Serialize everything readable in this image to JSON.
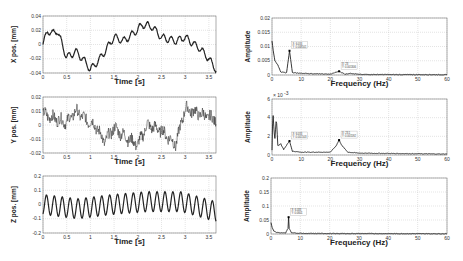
{
  "chart_data": [
    {
      "type": "line",
      "panel": "left-top",
      "xlabel": "Time [s]",
      "ylabel": "X pos. [mm]",
      "xlim": [
        0,
        3.65
      ],
      "ylim": [
        -0.04,
        0.04
      ],
      "xticks": [
        "0",
        "0.5",
        "1",
        "1.5",
        "2",
        "2.5",
        "3",
        "3.5"
      ],
      "yticks": [
        "0.04",
        "0.02",
        "0",
        "-0.02",
        "-0.04"
      ],
      "grid": true,
      "series": [
        {
          "name": "X position",
          "x": [
            0,
            0.1,
            0.2,
            0.3,
            0.5,
            0.7,
            0.9,
            1.0,
            1.2,
            1.5,
            1.7,
            1.9,
            2.1,
            2.3,
            2.5,
            2.8,
            3.0,
            3.3,
            3.5,
            3.65
          ],
          "values": [
            0.0,
            0.02,
            0.015,
            0.02,
            -0.018,
            -0.01,
            -0.025,
            -0.035,
            -0.02,
            0.01,
            0.005,
            0.015,
            0.028,
            0.025,
            0.01,
            0.005,
            0.01,
            -0.005,
            -0.02,
            -0.035
          ]
        }
      ]
    },
    {
      "type": "line",
      "panel": "left-middle",
      "xlabel": "Time [s]",
      "ylabel": "Y pos. [mm]",
      "xlim": [
        0,
        3.65
      ],
      "ylim": [
        -0.02,
        0.02
      ],
      "xticks": [
        "0",
        "0.5",
        "1",
        "1.5",
        "2",
        "2.5",
        "3",
        "3.5"
      ],
      "yticks": [
        "0.02",
        "0.01",
        "0",
        "-0.01",
        "-0.02"
      ],
      "grid": true,
      "series": [
        {
          "name": "Y position",
          "x": [
            0,
            0.3,
            0.5,
            0.7,
            0.9,
            1.1,
            1.3,
            1.5,
            1.8,
            2.0,
            2.2,
            2.5,
            2.8,
            3.0,
            3.3,
            3.65
          ],
          "values": [
            0.008,
            0.004,
            0.002,
            0.01,
            0.004,
            0.0,
            -0.012,
            -0.002,
            -0.01,
            -0.014,
            0.0,
            -0.004,
            -0.014,
            0.012,
            0.008,
            0.004
          ]
        }
      ]
    },
    {
      "type": "line",
      "panel": "left-bottom",
      "xlabel": "Time [s]",
      "ylabel": "Z pos. [mm]",
      "xlim": [
        0,
        3.65
      ],
      "ylim": [
        -0.2,
        0.2
      ],
      "xticks": [
        "0",
        "0.5",
        "1",
        "1.5",
        "2",
        "2.5",
        "3",
        "3.5"
      ],
      "yticks": [
        "0.2",
        "0.1",
        "0",
        "-0.1",
        "-0.2"
      ],
      "grid": true,
      "series": [
        {
          "name": "Z position",
          "oscillation_hz": 6.0,
          "amplitude": 0.07,
          "envelope_center": [
            0,
            -0.03,
            0.0,
            0.02,
            0.02,
            -0.05
          ]
        }
      ]
    },
    {
      "type": "line",
      "panel": "right-top",
      "xlabel": "Frequency (Hz)",
      "ylabel": "Amplitude",
      "xlim": [
        0,
        60
      ],
      "ylim": [
        0,
        0.02
      ],
      "xticks": [
        "0",
        "10",
        "20",
        "30",
        "40",
        "50",
        "60"
      ],
      "yticks": [
        "0.02",
        "0.015",
        "0.01",
        "0.005",
        "0"
      ],
      "grid": true,
      "peaks": [
        {
          "x": 6.0,
          "y": 0.0085,
          "label": [
            "X: 6.033",
            "Y: 0.008501"
          ]
        },
        {
          "x": 23.0,
          "y": 0.0013,
          "label": [
            "X: 23",
            "Y: 0.001306"
          ]
        }
      ],
      "series": [
        {
          "name": "X FFT",
          "x": [
            0,
            0.5,
            1,
            2,
            3,
            5,
            6,
            7,
            10,
            15,
            20,
            23,
            25,
            27,
            30,
            60
          ],
          "values": [
            0.012,
            0.008,
            0.005,
            0.0035,
            0.001,
            0.0008,
            0.0085,
            0.0008,
            0.0006,
            0.0004,
            0.0003,
            0.0013,
            0.0003,
            0.0006,
            0.0002,
            0.0001
          ]
        }
      ]
    },
    {
      "type": "line",
      "panel": "right-middle",
      "xlabel": "Frequency (Hz)",
      "ylabel": "Amplitude",
      "yscale_note": "x 10^-3",
      "xlim": [
        0,
        60
      ],
      "ylim": [
        0,
        6
      ],
      "xticks": [
        "0",
        "10",
        "20",
        "30",
        "40",
        "50",
        "60"
      ],
      "yticks": [
        "6",
        "4",
        "2",
        "0"
      ],
      "grid": true,
      "peaks": [
        {
          "x": 6.0,
          "y": 1.5,
          "label": [
            "X: 6.033",
            "Y: 0.001503"
          ]
        },
        {
          "x": 23.0,
          "y": 1.6,
          "label": [
            "X: 23.1",
            "Y: 0.001592"
          ]
        }
      ],
      "series": [
        {
          "name": "Y FFT (x10^-3)",
          "x": [
            0,
            0.3,
            0.7,
            1,
            1.5,
            2,
            3,
            4,
            6,
            7,
            10,
            20,
            22,
            23,
            24,
            26,
            30,
            60
          ],
          "values": [
            0.5,
            4.8,
            2.5,
            1.8,
            4.0,
            1.0,
            1.2,
            0.6,
            1.5,
            0.4,
            0.3,
            0.3,
            1.0,
            1.6,
            1.0,
            0.3,
            0.2,
            0.1
          ]
        }
      ]
    },
    {
      "type": "line",
      "panel": "right-bottom",
      "xlabel": "Frequency (Hz)",
      "ylabel": "Amplitude",
      "xlim": [
        0,
        60
      ],
      "ylim": [
        0,
        0.2
      ],
      "xticks": [
        "0",
        "10",
        "20",
        "30",
        "40",
        "50",
        "60"
      ],
      "yticks": [
        "0.2",
        "0.15",
        "0.1",
        "0.05",
        "0"
      ],
      "grid": true,
      "peaks": [
        {
          "x": 6.0,
          "y": 0.06,
          "label": [
            "X: 6.033",
            "Y: 0.0601"
          ]
        }
      ],
      "series": [
        {
          "name": "Z FFT",
          "x": [
            0,
            0.5,
            1,
            2,
            5,
            5.8,
            6,
            6.2,
            7,
            12,
            60
          ],
          "values": [
            0.04,
            0.02,
            0.01,
            0.005,
            0.004,
            0.02,
            0.06,
            0.02,
            0.004,
            0.002,
            0.001
          ]
        }
      ]
    }
  ]
}
